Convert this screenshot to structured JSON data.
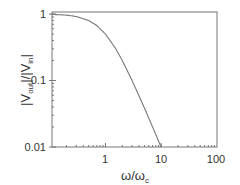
{
  "chart_data": {
    "type": "line",
    "title": "",
    "xlabel": "ω/ω_c",
    "ylabel": "|V_out|/|V_in|",
    "xscale": "log",
    "yscale": "log",
    "xlim": [
      0.11,
      100
    ],
    "ylim": [
      0.01,
      1
    ],
    "xticks": [
      "1",
      "10",
      "100"
    ],
    "yticks": [
      "0.01",
      "0.1",
      "1"
    ],
    "grid": false,
    "legend": null,
    "series": [
      {
        "name": "response",
        "color": "#777777",
        "x": [
          0.11,
          0.2,
          0.3,
          0.5,
          0.7,
          1,
          1.5,
          2,
          3,
          5,
          7,
          10
        ],
        "y": [
          0.988,
          0.962,
          0.917,
          0.8,
          0.671,
          0.5,
          0.308,
          0.2,
          0.1,
          0.0385,
          0.02,
          0.0099
        ]
      }
    ]
  },
  "labels": {
    "y_tick_1": "1",
    "y_tick_01": "0.1",
    "y_tick_001": "0.01",
    "x_tick_1": "1",
    "x_tick_10": "10",
    "x_tick_100": "100",
    "y_axis_main": "|V",
    "y_axis_sub1": "out",
    "y_axis_mid": "|/|V",
    "y_axis_sub2": "in",
    "y_axis_end": "|",
    "x_axis_main": "ω/ω",
    "x_axis_sub": "c"
  }
}
